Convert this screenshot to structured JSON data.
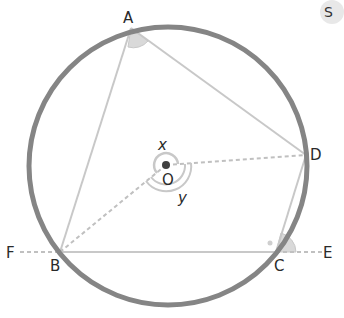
{
  "diagram": {
    "type": "circle-geometry",
    "colors": {
      "circle": "#858585",
      "chord": "#c8c8c8",
      "dashed": "#c0c0c0",
      "angle_fill": "#d9d9d9",
      "center_dot": "#404040",
      "text": "#2a2a2a"
    },
    "points": {
      "A": {
        "label": "A"
      },
      "B": {
        "label": "B"
      },
      "C": {
        "label": "C"
      },
      "D": {
        "label": "D"
      },
      "E": {
        "label": "E"
      },
      "F": {
        "label": "F"
      },
      "O": {
        "label": "O"
      }
    },
    "angles": {
      "x": {
        "label": "x"
      },
      "y": {
        "label": "y"
      }
    },
    "corner_glyph": "S"
  }
}
